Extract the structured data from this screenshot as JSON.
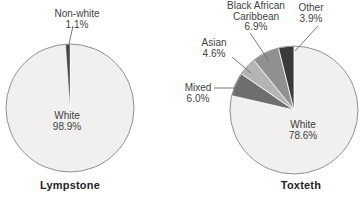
{
  "colors": {
    "background": "#ffffff",
    "outline": "#8e8e8e",
    "leader_line": "#6b6b6b",
    "label_text": "#3f3f3f",
    "title_text": "#1f1f1f",
    "white_slice": "#f1f0ee",
    "dark_slice": "#3a3a3a"
  },
  "chart_data": [
    {
      "type": "pie",
      "title": "Lympstone",
      "start_angle_deg": 0,
      "direction": "clockwise",
      "slices": [
        {
          "label": "White",
          "value": 98.9,
          "display": "98.9%",
          "color": "#f1f0ee",
          "label_position": "inside"
        },
        {
          "label": "Non-white",
          "value": 1.1,
          "display": "1.1%",
          "color": "#474747",
          "label_position": "callout-top"
        }
      ]
    },
    {
      "type": "pie",
      "title": "Toxteth",
      "start_angle_deg": 0,
      "direction": "clockwise",
      "slices": [
        {
          "label": "White",
          "value": 78.6,
          "display": "78.6%",
          "color": "#f1f0ee",
          "label_position": "inside"
        },
        {
          "label": "Mixed",
          "value": 6.0,
          "display": "6.0%",
          "color": "#6e6e6e",
          "label_position": "callout-left"
        },
        {
          "label": "Asian",
          "value": 4.6,
          "display": "4.6%",
          "color": "#b4b4b3",
          "label_position": "callout-upper-left"
        },
        {
          "label": "Black African Caribbean",
          "value": 6.9,
          "display": "6.9%",
          "color": "#909090",
          "label_position": "callout-top"
        },
        {
          "label": "Other",
          "value": 3.9,
          "display": "3.9%",
          "color": "#3a3a3a",
          "label_position": "callout-top-right"
        }
      ]
    }
  ]
}
